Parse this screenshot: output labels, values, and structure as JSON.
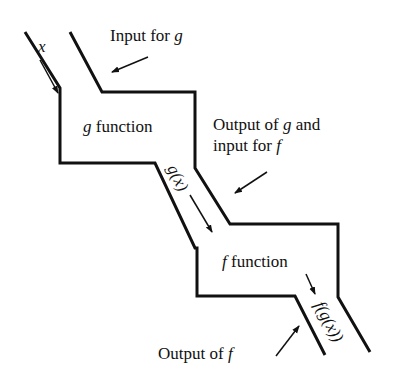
{
  "diagram": {
    "type": "function-composition-pipeline",
    "labels": {
      "input_x": "x",
      "input_for_g_prefix": "Input for ",
      "input_for_g_var": "g",
      "g_box_var": "g",
      "g_box_text": " function",
      "out_g_line1_prefix": "Output of ",
      "out_g_line1_var": "g",
      "out_g_line1_suffix": " and",
      "out_g_line2_prefix": "input for ",
      "out_g_line2_var": "f",
      "g_of_x": "g(x)",
      "f_box_var": "f",
      "f_box_text": " function",
      "f_of_g_of_x": "f(g(x))",
      "output_f_prefix": "Output of ",
      "output_f_var": "f"
    },
    "nodes": [
      {
        "id": "g",
        "label": "g function"
      },
      {
        "id": "f",
        "label": "f function"
      }
    ],
    "edges": [
      {
        "from": "input",
        "to": "g",
        "label": "x"
      },
      {
        "from": "g",
        "to": "f",
        "label": "g(x)"
      },
      {
        "from": "f",
        "to": "output",
        "label": "f(g(x))"
      }
    ],
    "stroke_color": "#111111",
    "background": "#ffffff"
  }
}
